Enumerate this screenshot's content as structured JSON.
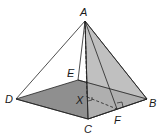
{
  "diagram": {
    "type": "square pyramid",
    "colors": {
      "base_fill": "#8f8f8f",
      "right_face_fill": "#b5b5b5",
      "edge": "#222222",
      "background": "#ffffff"
    },
    "vertices": {
      "A": {
        "label": "A",
        "x": 85,
        "y": 21
      },
      "B": {
        "label": "B",
        "x": 147,
        "y": 99
      },
      "C": {
        "label": "C",
        "x": 88,
        "y": 119
      },
      "D": {
        "label": "D",
        "x": 16,
        "y": 99
      },
      "E": {
        "label": "E",
        "x": 78,
        "y": 80
      },
      "X": {
        "label": "X",
        "x": 87,
        "y": 97
      },
      "F": {
        "label": "F",
        "x": 117,
        "y": 109
      }
    },
    "labels": {
      "A": "A",
      "B": "B",
      "C": "C",
      "D": "D",
      "E": "E",
      "X": "X",
      "F": "F"
    },
    "right_angle_marks": [
      "at X between AX and XF",
      "at F between XF and CB"
    ]
  }
}
